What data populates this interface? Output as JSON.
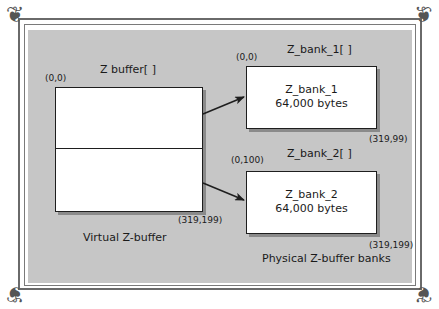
{
  "virtual": {
    "title": "Z buffer[ ]",
    "origin": "(0,0)",
    "end": "(319,199)",
    "caption": "Virtual Z-buffer"
  },
  "bank1": {
    "title": "Z_bank_1[ ]",
    "origin": "(0,0)",
    "end": "(319,99)",
    "name": "Z_bank_1",
    "size": "64,000 bytes"
  },
  "bank2": {
    "title": "Z_bank_2[ ]",
    "origin": "(0,100)",
    "end": "(319,199)",
    "name": "Z_bank_2",
    "size": "64,000 bytes"
  },
  "physical": {
    "caption": "Physical Z-buffer banks"
  },
  "colors": {
    "panel": "#c6c6c6",
    "box": "#ffffff",
    "stroke": "#1e1e1e",
    "shadow": "#8a8a8a"
  }
}
